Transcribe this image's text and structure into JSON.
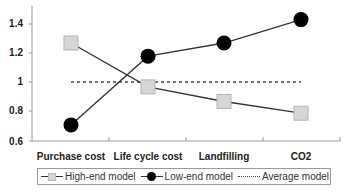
{
  "chart_data": {
    "type": "line",
    "title": "",
    "xlabel": "",
    "ylabel": "",
    "categories": [
      "Purchase cost",
      "Life cycle cost",
      "Landfilling",
      "CO2"
    ],
    "series": [
      {
        "name": "High-end model",
        "marker": "square",
        "color": "#d6d6d6",
        "values": [
          1.27,
          0.97,
          0.87,
          0.79
        ]
      },
      {
        "name": "Low-end model",
        "marker": "circle",
        "color": "#000000",
        "values": [
          0.71,
          1.18,
          1.27,
          1.43
        ]
      },
      {
        "name": "Average model",
        "marker": "none",
        "style": "dotted",
        "color": "#444444",
        "values": [
          1.0,
          1.0,
          1.0,
          1.0
        ]
      }
    ],
    "ylim": [
      0.6,
      1.5
    ],
    "yticks": [
      "1.4",
      "1.2",
      "1",
      "0.8",
      "0.6"
    ],
    "grid": false,
    "legend_position": "bottom"
  },
  "axis": {
    "yticks": [
      "1.4",
      "1.2",
      "1",
      "0.8",
      "0.6"
    ],
    "categories": [
      "Purchase cost",
      "Life cycle cost",
      "Landfilling",
      "CO2"
    ]
  },
  "legend": {
    "high_end": "High-end model",
    "low_end": "Low-end model",
    "average": "Average model"
  }
}
